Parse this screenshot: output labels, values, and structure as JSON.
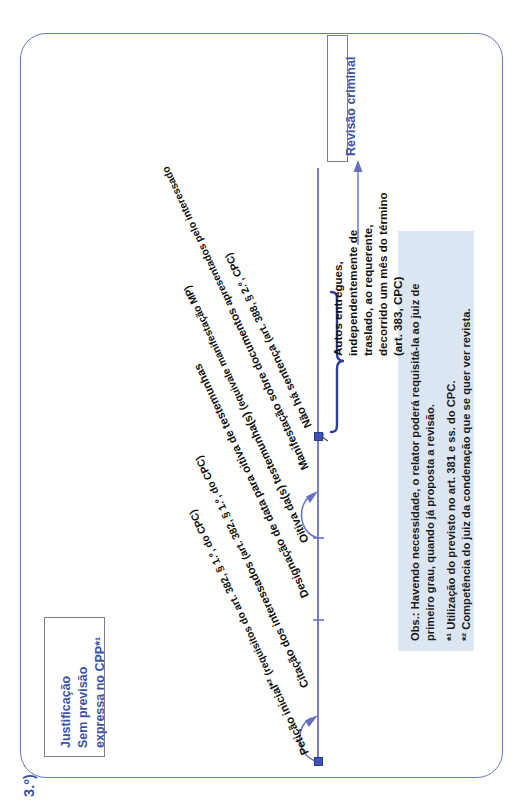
{
  "header": {
    "title": "3.º) Justificação"
  },
  "colors": {
    "frame_border": "#6c76c4",
    "accent_blue": "#3b53a4",
    "timeline": "#6670c0",
    "node": "#3f51b5",
    "notes_bg": "#dce6f2",
    "box_border": "#7d7d8c",
    "text": "#111111"
  },
  "boxes": {
    "start": {
      "name": "Justificação",
      "lines": [
        "Justificação",
        "Sem previsão",
        "expressa no CPP*¹"
      ]
    },
    "end": {
      "label": "Revisão criminal"
    }
  },
  "timeline": {
    "steps": [
      {
        "id": "peticao-inicial",
        "title": "Petição inicial*²",
        "ref": "(requisitos do art. 382, § 1.º, do CPC)"
      },
      {
        "id": "citacao",
        "title": "Citação dos interessados",
        "ref": "(art. 382, § 1.º, do CPC)"
      },
      {
        "id": "designacao-data",
        "title": "Designação de data para oitiva de testemunhas",
        "ref": ""
      },
      {
        "id": "oitiva-testemunhas",
        "title": "Oitiva da(s) testemunha(s)",
        "ref": "(equivale manifestação MP)"
      },
      {
        "id": "manifestacao-documentos",
        "title": "Manifestação sobre documentos",
        "ref": "apresentados pelo interessado"
      },
      {
        "id": "nao-ha-sentenca",
        "title": "Não há sentença",
        "ref": "(art. 388, § 2.º, CPC)"
      }
    ],
    "final_note": {
      "lines": [
        "Autos entregues,",
        "independentemente de",
        "traslado, ao requerente,",
        "decorrido um mês do término",
        "(art. 383, CPC)"
      ]
    }
  },
  "notes": {
    "lines": [
      "Obs.: Havendo necessidade, o relator poderá requisitá-la ao juiz de",
      "primeiro grau, quando já proposta a revisão.",
      "*¹ Utilização do previsto no art. 381 e ss. do CPC.",
      "*² Competência do juiz da condenação que se quer ver revista."
    ]
  }
}
